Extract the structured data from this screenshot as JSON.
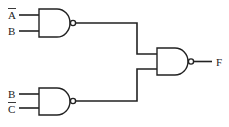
{
  "diagram": {
    "type": "logic-circuit",
    "gates": [
      {
        "id": "nand1",
        "type": "NAND",
        "inputs": [
          "A̅",
          "B"
        ]
      },
      {
        "id": "nand2",
        "type": "NAND",
        "inputs": [
          "B",
          "C̅"
        ]
      },
      {
        "id": "nand3",
        "type": "NAND",
        "inputs": [
          "nand1",
          "nand2"
        ],
        "output": "F"
      }
    ],
    "labels": {
      "in_a_bar": "A",
      "in_b_top": "B",
      "in_b_bottom": "B",
      "in_c_bar": "C",
      "output": "F"
    }
  }
}
